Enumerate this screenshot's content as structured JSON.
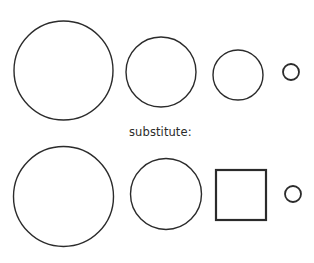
{
  "canvas": {
    "width": 314,
    "height": 263,
    "background": "#ffffff"
  },
  "style": {
    "stroke_color": "#2b2b2b",
    "fill": "none",
    "default_stroke_width": 1.4,
    "square_stroke_width": 2.2,
    "text_color": "#2b2b2b"
  },
  "labels": {
    "substitute": "substitute:"
  },
  "label_positions": {
    "substitute": {
      "x": 129,
      "y": 136,
      "font_size": 11.5
    }
  },
  "chart_data": {
    "type": "diagram",
    "title": "",
    "rows": [
      {
        "name": "top-row",
        "index": 0,
        "shapes": [
          {
            "id": "top-circle-1",
            "kind": "circle",
            "cx": 63.5,
            "cy": 70.5,
            "r": 49.5,
            "diameter": 99,
            "stroke_width": 1.4
          },
          {
            "id": "top-circle-2",
            "kind": "circle",
            "cx": 161,
            "cy": 72,
            "r": 35,
            "diameter": 70,
            "stroke_width": 1.4
          },
          {
            "id": "top-circle-3",
            "kind": "circle",
            "cx": 238,
            "cy": 75,
            "r": 25,
            "diameter": 50,
            "stroke_width": 1.4
          },
          {
            "id": "top-circle-4",
            "kind": "circle",
            "cx": 291,
            "cy": 72,
            "r": 8,
            "diameter": 16,
            "stroke_width": 1.8
          }
        ]
      },
      {
        "name": "bottom-row",
        "index": 1,
        "shapes": [
          {
            "id": "bottom-circle-1",
            "kind": "circle",
            "cx": 63.5,
            "cy": 196.5,
            "r": 50,
            "diameter": 100,
            "stroke_width": 1.4
          },
          {
            "id": "bottom-circle-2",
            "kind": "circle",
            "cx": 166,
            "cy": 194,
            "r": 35.5,
            "diameter": 71,
            "stroke_width": 1.4
          },
          {
            "id": "bottom-square-3",
            "kind": "square",
            "x": 216,
            "y": 170,
            "width": 50,
            "height": 50,
            "stroke_width": 2.2
          },
          {
            "id": "bottom-circle-4",
            "kind": "circle",
            "cx": 293,
            "cy": 194,
            "r": 8,
            "diameter": 16,
            "stroke_width": 1.8
          }
        ]
      }
    ],
    "annotations": [
      {
        "text": "substitute:",
        "x": 129,
        "y": 136
      }
    ]
  }
}
